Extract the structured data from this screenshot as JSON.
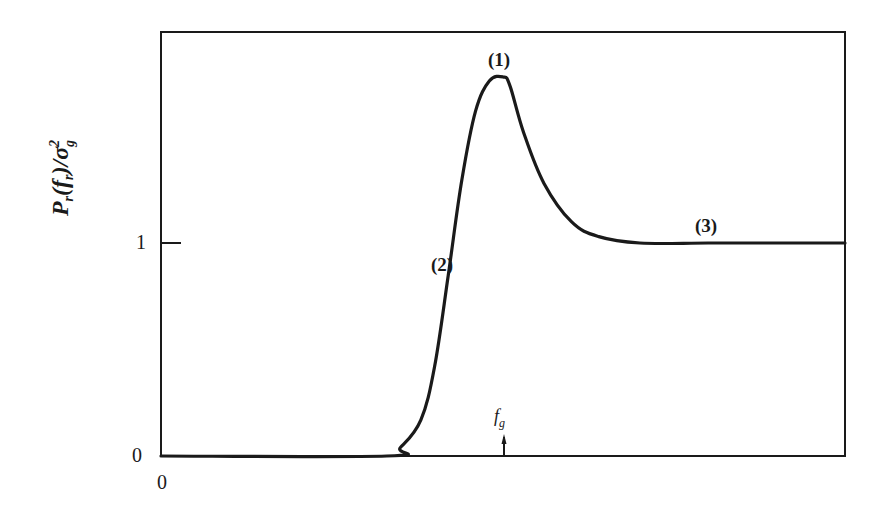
{
  "chart_data": {
    "type": "line",
    "title": "",
    "xlabel": "",
    "ylabel": "P_r(f_r)/σ_g²",
    "ylabel_parts": {
      "main": "P",
      "sub1": "r",
      "open": "(f",
      "sub2": "r",
      "close": ")/σ",
      "sub3": "g",
      "sup": "2"
    },
    "x_tick_labels": [
      "0"
    ],
    "y_tick_labels": [
      "0",
      "1"
    ],
    "y_ticks": [
      0,
      1
    ],
    "ylim": [
      0,
      2.0
    ],
    "xlim": [
      0,
      1.0
    ],
    "grid": false,
    "legend": null,
    "annotations": [
      {
        "text": "(1)",
        "meaning": "resonance peak",
        "x": 0.5,
        "y": 1.77
      },
      {
        "text": "(2)",
        "meaning": "rising region below f_g",
        "x": 0.43,
        "y": 0.85
      },
      {
        "text": "(3)",
        "meaning": "high-frequency plateau",
        "x": 0.8,
        "y": 1.03
      },
      {
        "text": "f_g",
        "meaning": "marked frequency with arrow on x-axis",
        "x": 0.5,
        "y": 0.0
      }
    ],
    "series": [
      {
        "name": "P_r(f_r)/σ_g²",
        "x": [
          0.0,
          0.33,
          0.35,
          0.38,
          0.4,
          0.42,
          0.44,
          0.46,
          0.48,
          0.5,
          0.51,
          0.53,
          0.56,
          0.6,
          0.64,
          0.7,
          0.8,
          0.9,
          1.0
        ],
        "y": [
          0.0,
          0.0,
          0.04,
          0.17,
          0.42,
          0.85,
          1.3,
          1.62,
          1.76,
          1.78,
          1.74,
          1.52,
          1.28,
          1.1,
          1.03,
          1.0,
          1.0,
          1.0,
          1.0
        ]
      }
    ]
  },
  "labels": {
    "x_zero": "0",
    "y_zero": "0",
    "y_one": "1",
    "peak": "(1)",
    "rise": "(2)",
    "plateau": "(3)",
    "fg_main": "f",
    "fg_sub": "g"
  },
  "ylabel": {
    "p": "P",
    "r1": "r",
    "open": "(f",
    "r2": "r",
    "close": ")/σ",
    "g": "g",
    "two": "2"
  },
  "colors": {
    "ink": "#1a1a1a",
    "background": "#ffffff"
  }
}
